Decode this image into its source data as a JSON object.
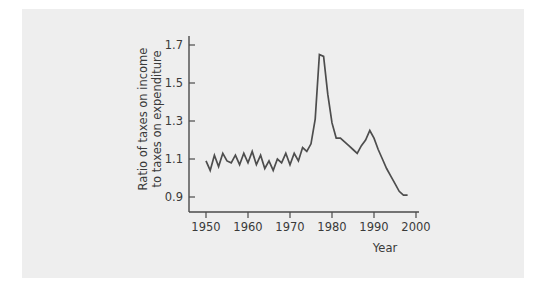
{
  "figure": {
    "background_color": "#eeeeee",
    "page_color": "#ffffff",
    "line_color": "#4d4d4d",
    "axis_color": "#4a4a4a"
  },
  "chart_data": {
    "type": "line",
    "title": "",
    "xlabel": "Year",
    "ylabel_line1": "Ratio of taxes on income",
    "ylabel_line2": "to taxes on expenditure",
    "ylabel": "Ratio of taxes on income to taxes on expenditure",
    "xlim": [
      1948,
      2001
    ],
    "ylim": [
      0.86,
      1.74
    ],
    "xticks": [
      1950,
      1960,
      1970,
      1980,
      1990,
      2000
    ],
    "xticklabels": [
      "1950",
      "1960",
      "1970",
      "1980",
      "1990",
      "2000"
    ],
    "yticks": [
      0.9,
      1.1,
      1.3,
      1.5,
      1.7
    ],
    "yticklabels": [
      "0.9",
      "1.1",
      "1.3",
      "1.5",
      "1.7"
    ],
    "grid": false,
    "legend": false,
    "series": [
      {
        "name": "Ratio of taxes on income to taxes on expenditure",
        "x": [
          1950,
          1951,
          1952,
          1953,
          1954,
          1955,
          1956,
          1957,
          1958,
          1959,
          1960,
          1961,
          1962,
          1963,
          1964,
          1965,
          1966,
          1967,
          1968,
          1969,
          1970,
          1971,
          1972,
          1973,
          1974,
          1975,
          1976,
          1977,
          1978,
          1979,
          1980,
          1981,
          1982,
          1983,
          1984,
          1985,
          1986,
          1987,
          1988,
          1989,
          1990,
          1991,
          1992,
          1993,
          1994,
          1995,
          1996,
          1997,
          1998
        ],
        "values": [
          1.09,
          1.04,
          1.12,
          1.06,
          1.13,
          1.09,
          1.08,
          1.12,
          1.07,
          1.13,
          1.08,
          1.14,
          1.07,
          1.12,
          1.05,
          1.09,
          1.04,
          1.1,
          1.08,
          1.13,
          1.07,
          1.13,
          1.09,
          1.16,
          1.14,
          1.18,
          1.31,
          1.65,
          1.64,
          1.44,
          1.29,
          1.21,
          1.21,
          1.19,
          1.17,
          1.15,
          1.13,
          1.17,
          1.2,
          1.25,
          1.21,
          1.15,
          1.1,
          1.05,
          1.01,
          0.97,
          0.93,
          0.91,
          0.91
        ]
      }
    ]
  }
}
